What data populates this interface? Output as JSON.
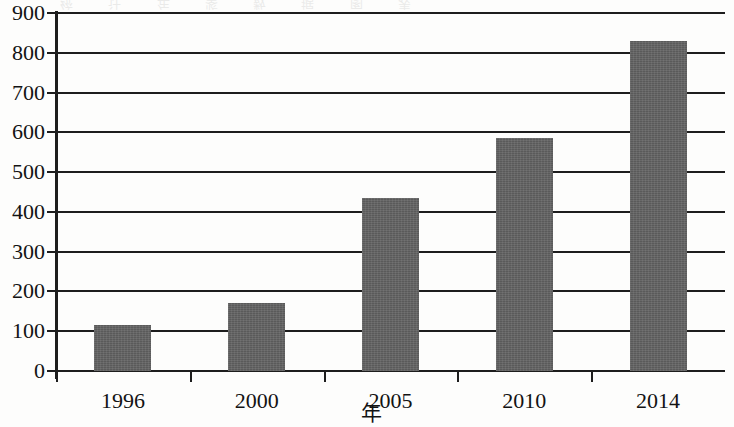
{
  "figure": {
    "background_color": "#fdfdfc",
    "bar_color": "#636363",
    "axis_color": "#1d1d1d",
    "bleed_artifact_text": "统 计 年 鉴 数 据 图 表"
  },
  "chart_data": {
    "type": "bar",
    "title": "",
    "subtitle": "",
    "xlabel": "年",
    "ylabel": "",
    "categories": [
      "1996",
      "2000",
      "2005",
      "2010",
      "2014"
    ],
    "values": [
      115,
      172,
      435,
      585,
      830
    ],
    "ylim": [
      0,
      900
    ],
    "ytick_labels": [
      "900",
      "800",
      "700",
      "600",
      "500",
      "400",
      "300",
      "200",
      "100",
      "0"
    ],
    "ytick_values": [
      900,
      800,
      700,
      600,
      500,
      400,
      300,
      200,
      100,
      0
    ],
    "ytick_step": 100,
    "grid": true,
    "grid_axis": "y",
    "legend": null,
    "legend_position": "none",
    "annotations": [],
    "series": [
      {
        "name": "",
        "values": [
          115,
          172,
          435,
          585,
          830
        ]
      }
    ]
  }
}
